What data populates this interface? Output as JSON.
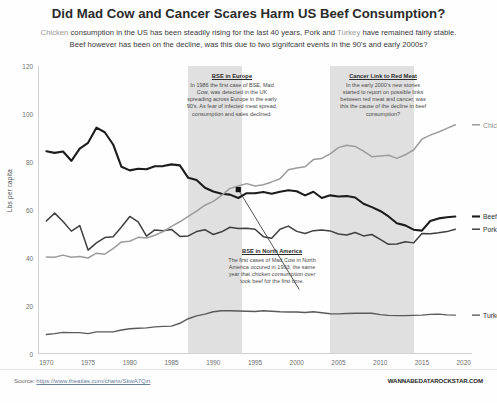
{
  "header": {
    "title": "Did Mad Cow and Cancer Scares Harm US Beef Consumption?",
    "subtitle_part1": "Chicken",
    "subtitle_part2": " consumption in the US has been steadily rising for the last 40 years, Pork and ",
    "subtitle_part3": "Turkey",
    "subtitle_part4": " have remained fairly stable.",
    "subtitle_line2": "Beef however has been on the decline, was this due to two signifcant events in the 90's and early 2000s?"
  },
  "footer": {
    "source_label": "Source: ",
    "source_url": "https://www.theatlas.com/charts/SkwA7Qzt",
    "brand": "WANNABEDATAROCKSTAR.COM"
  },
  "annotations": [
    {
      "id": "bse-europe",
      "heading": "BSE in Europe",
      "body": "In 1986 the first case of BSE, Mad Cow, was detected in the UK spreading across Europe in the early 90's. As fear of infected meat spread, consumption and sales declined."
    },
    {
      "id": "cancer-link",
      "heading": "Cancer Link to Red Meat",
      "body": "In the early 2000's new stories started to report on possible links between red meat and cancer, was this the cause of the decline in beef consumption?"
    },
    {
      "id": "bse-north-america",
      "heading": "BSE in North America",
      "body": "The first cases of Mad Cow in North America occured in 1993, the same year that chicken consumption over took beef for the first time."
    }
  ],
  "chart_data": {
    "type": "line",
    "title": "Did Mad Cow and Cancer Scares Harm US Beef Consumption?",
    "xlabel": "",
    "ylabel": "Lbs per capita",
    "xlim": [
      1969,
      2021
    ],
    "ylim": [
      0,
      120
    ],
    "yticks": [
      0,
      20,
      40,
      60,
      80,
      100,
      120
    ],
    "xticks": [
      1970,
      1975,
      1980,
      1985,
      1990,
      1995,
      2000,
      2005,
      2010,
      2015,
      2020
    ],
    "grid": false,
    "legend": "inline-end-labels",
    "colors": {
      "beef": "#1c1c1c",
      "pork": "#3f3f3f",
      "chicken": "#9c9c9c",
      "turkey": "#5a5a5a",
      "band": "#d4d4d4",
      "accent_marker": "#111111"
    },
    "shaded_bands": [
      {
        "label": "BSE in Europe era",
        "start": 1987,
        "end": 1993.4
      },
      {
        "label": "Cancer link era",
        "start": 2004,
        "end": 2014.1
      }
    ],
    "marker_points": [
      {
        "label": "Chicken overtakes Beef",
        "x": 1993,
        "y": 68.5
      }
    ],
    "x": [
      1970,
      1971,
      1972,
      1973,
      1974,
      1975,
      1976,
      1977,
      1978,
      1979,
      1980,
      1981,
      1982,
      1983,
      1984,
      1985,
      1986,
      1987,
      1988,
      1989,
      1990,
      1991,
      1992,
      1993,
      1994,
      1995,
      1996,
      1997,
      1998,
      1999,
      2000,
      2001,
      2002,
      2003,
      2004,
      2005,
      2006,
      2007,
      2008,
      2009,
      2010,
      2011,
      2012,
      2013,
      2014,
      2015,
      2016,
      2017,
      2018,
      2019
    ],
    "series": [
      {
        "name": "Beef",
        "label": "Beef",
        "color": "#1c1c1c",
        "values": [
          84.5,
          83.8,
          84.4,
          80.5,
          85.6,
          88.0,
          94.3,
          92.4,
          87.3,
          78.0,
          76.5,
          77.2,
          77.0,
          78.2,
          78.3,
          79.0,
          78.6,
          73.4,
          72.5,
          69.3,
          67.7,
          66.8,
          66.4,
          65.0,
          67.0,
          67.0,
          67.5,
          66.8,
          67.6,
          68.2,
          67.8,
          66.1,
          67.6,
          65.0,
          66.1,
          65.6,
          65.8,
          65.2,
          62.6,
          61.2,
          59.6,
          57.3,
          54.5,
          53.6,
          51.8,
          51.4,
          55.4,
          56.5,
          57.0,
          57.3
        ]
      },
      {
        "name": "Pork",
        "label": "Pork",
        "color": "#3f3f3f",
        "values": [
          55.4,
          58.7,
          55.2,
          51.2,
          53.5,
          43.3,
          46.3,
          48.5,
          48.9,
          52.9,
          57.3,
          55.1,
          49.1,
          51.7,
          51.4,
          51.9,
          49.0,
          49.2,
          51.0,
          51.8,
          49.8,
          50.9,
          52.8,
          52.3,
          52.4,
          52.0,
          48.9,
          48.2,
          52.0,
          53.3,
          51.1,
          50.2,
          51.4,
          51.7,
          51.3,
          50.0,
          49.6,
          50.6,
          49.2,
          49.8,
          47.8,
          45.7,
          45.8,
          46.8,
          46.3,
          50.2,
          50.1,
          50.5,
          51.0,
          52.0
        ]
      },
      {
        "name": "Chicken",
        "label": "Chicken",
        "color": "#9c9c9c",
        "values": [
          40.4,
          40.3,
          41.2,
          40.3,
          40.6,
          40.0,
          42.0,
          41.6,
          43.9,
          46.7,
          47.0,
          48.6,
          48.3,
          49.5,
          51.0,
          53.2,
          55.1,
          57.3,
          59.5,
          62.0,
          63.6,
          66.1,
          69.0,
          70.0,
          71.0,
          70.0,
          70.5,
          71.7,
          73.0,
          76.8,
          77.5,
          78.0,
          81.0,
          81.5,
          83.4,
          86.0,
          87.0,
          86.5,
          84.5,
          82.2,
          82.5,
          82.8,
          81.5,
          83.0,
          85.0,
          89.5,
          91.2,
          92.5,
          94.0,
          95.5
        ]
      },
      {
        "name": "Turkey",
        "label": "Turkey",
        "color": "#5a5a5a",
        "values": [
          8.1,
          8.5,
          9.0,
          8.9,
          8.9,
          8.5,
          9.2,
          9.2,
          9.2,
          10.0,
          10.5,
          10.7,
          10.9,
          11.3,
          11.5,
          11.6,
          12.8,
          14.7,
          15.9,
          16.6,
          17.6,
          18.0,
          18.0,
          17.9,
          17.8,
          17.7,
          18.0,
          17.8,
          17.6,
          17.5,
          17.5,
          17.3,
          17.6,
          17.2,
          16.8,
          16.7,
          16.9,
          17.0,
          17.0,
          17.0,
          16.4,
          16.1,
          16.0,
          16.0,
          16.1,
          16.2,
          16.5,
          16.6,
          16.3,
          16.2
        ]
      }
    ]
  }
}
